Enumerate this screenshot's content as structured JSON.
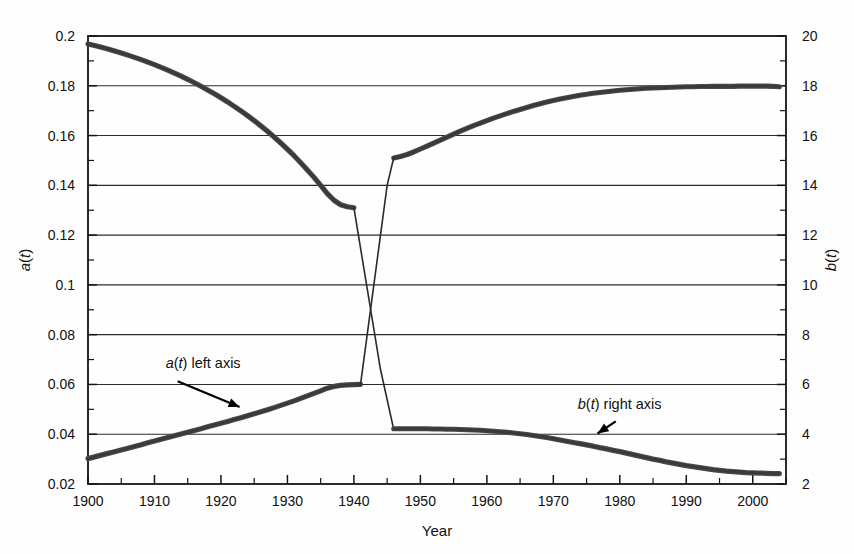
{
  "chart_data": {
    "type": "line",
    "title": "",
    "xlabel": "Year",
    "ylabel_left": "a(t)",
    "ylabel_right": "b(t)",
    "xlim": [
      1900,
      2005
    ],
    "ylim_left": [
      0.02,
      0.2
    ],
    "ylim_right": [
      2,
      20
    ],
    "grid": true,
    "legend_position": "inline-annotations",
    "x_ticks": [
      1900,
      1910,
      1920,
      1930,
      1940,
      1950,
      1960,
      1970,
      1980,
      1990,
      2000
    ],
    "x_tick_labels": [
      "1900",
      "1910",
      "1920",
      "1930",
      "1940",
      "1950",
      "1960",
      "1970",
      "1980",
      "1990",
      "2000"
    ],
    "x_minor_step": 5,
    "y_ticks_left": [
      0.02,
      0.04,
      0.06,
      0.08,
      0.1,
      0.12,
      0.14,
      0.16,
      0.18,
      0.2
    ],
    "y_tick_labels_left": [
      "0.02",
      "0.04",
      "0.06",
      "0.08",
      "0.1",
      "0.12",
      "0.14",
      "0.16",
      "0.18",
      "0.2"
    ],
    "y_ticks_right": [
      2,
      4,
      6,
      8,
      10,
      12,
      14,
      16,
      18,
      20
    ],
    "y_tick_labels_right": [
      "2",
      "4",
      "6",
      "8",
      "10",
      "12",
      "14",
      "16",
      "18",
      "20"
    ],
    "y_minor_step_left": 0.01,
    "y_minor_step_right": 1,
    "annotations": [
      {
        "text": "a(t) left axis",
        "x": 1918,
        "y_left": 0.0665,
        "arrow_to_x": 1921,
        "arrow_to_y_left": 0.0505
      },
      {
        "text": "b(t) right axis",
        "x": 1983,
        "y_right": 5.0,
        "arrow_to_x": 1978,
        "arrow_to_y_right": 4.15
      }
    ],
    "series": [
      {
        "name": "a(t) left axis",
        "axis": "left",
        "color": "#424242",
        "note": "Declining branch 1900-1940, wartime drop to crossing, recovering branch 1946-2004",
        "segments": [
          {
            "id": "decline-1900-1940",
            "x": [
              1900,
              1901,
              1902,
              1903,
              1904,
              1905,
              1906,
              1907,
              1908,
              1909,
              1910,
              1911,
              1912,
              1913,
              1914,
              1915,
              1916,
              1917,
              1918,
              1919,
              1920,
              1921,
              1922,
              1923,
              1924,
              1925,
              1926,
              1927,
              1928,
              1929,
              1930,
              1931,
              1932,
              1933,
              1934,
              1935,
              1936,
              1937,
              1938,
              1939,
              1940
            ],
            "y": [
              0.1968,
              0.1962,
              0.1955,
              0.1948,
              0.194,
              0.1932,
              0.1923,
              0.1914,
              0.1905,
              0.1895,
              0.1885,
              0.1874,
              0.1863,
              0.1851,
              0.1839,
              0.1826,
              0.1812,
              0.1798,
              0.1783,
              0.1768,
              0.1752,
              0.1735,
              0.1717,
              0.1699,
              0.168,
              0.166,
              0.1639,
              0.1617,
              0.1594,
              0.157,
              0.1545,
              0.1519,
              0.1491,
              0.1462,
              0.1432,
              0.14,
              0.1367,
              0.134,
              0.1322,
              0.1314,
              0.131
            ]
          },
          {
            "id": "wartime-drop-1940-1946",
            "x": [
              1940,
              1942,
              1944,
              1946
            ],
            "y": [
              0.131,
              0.0985,
              0.066,
              0.0418
            ]
          },
          {
            "id": "recovery-1946-2004",
            "x": [
              1946,
              1947,
              1948,
              1949,
              1950,
              1951,
              1952,
              1953,
              1954,
              1955,
              1956,
              1957,
              1958,
              1959,
              1960,
              1961,
              1962,
              1963,
              1964,
              1965,
              1966,
              1967,
              1968,
              1969,
              1970,
              1971,
              1972,
              1973,
              1974,
              1975,
              1976,
              1977,
              1978,
              1979,
              1980,
              1981,
              1982,
              1983,
              1984,
              1985,
              1986,
              1987,
              1988,
              1989,
              1990,
              1991,
              1992,
              1993,
              1994,
              1995,
              1996,
              1997,
              1998,
              1999,
              2000,
              2001,
              2002,
              2003,
              2004
            ],
            "y": [
              0.151,
              0.1516,
              0.1524,
              0.1534,
              0.1546,
              0.1558,
              0.157,
              0.1582,
              0.1594,
              0.1606,
              0.1618,
              0.1629,
              0.164,
              0.165,
              0.166,
              0.167,
              0.1679,
              0.1688,
              0.1697,
              0.1705,
              0.1713,
              0.1721,
              0.1728,
              0.1735,
              0.1741,
              0.1747,
              0.1752,
              0.1757,
              0.1762,
              0.1766,
              0.177,
              0.1773,
              0.1776,
              0.1779,
              0.1782,
              0.1784,
              0.1786,
              0.1788,
              0.179,
              0.1791,
              0.1792,
              0.1793,
              0.1794,
              0.1795,
              0.1796,
              0.1796,
              0.1797,
              0.1797,
              0.1798,
              0.1798,
              0.1798,
              0.1798,
              0.1799,
              0.1799,
              0.1799,
              0.1799,
              0.1799,
              0.1798,
              0.1796
            ]
          }
        ]
      },
      {
        "name": "b(t) right axis",
        "axis": "right",
        "color": "#424242",
        "note": "Rising branch 1900-1940 on right scale, wartime spike, then slow decline 1946-2004",
        "segments": [
          {
            "id": "rise-1900-1940",
            "x": [
              1900,
              1901,
              1902,
              1903,
              1904,
              1905,
              1906,
              1907,
              1908,
              1909,
              1910,
              1911,
              1912,
              1913,
              1914,
              1915,
              1916,
              1917,
              1918,
              1919,
              1920,
              1921,
              1922,
              1923,
              1924,
              1925,
              1926,
              1927,
              1928,
              1929,
              1930,
              1931,
              1932,
              1933,
              1934,
              1935,
              1936,
              1937,
              1938,
              1939,
              1940,
              1941
            ],
            "y": [
              3.02,
              3.09,
              3.16,
              3.23,
              3.3,
              3.37,
              3.44,
              3.51,
              3.58,
              3.66,
              3.73,
              3.8,
              3.87,
              3.94,
              4.01,
              4.08,
              4.15,
              4.22,
              4.3,
              4.37,
              4.44,
              4.51,
              4.59,
              4.66,
              4.74,
              4.82,
              4.9,
              4.98,
              5.07,
              5.16,
              5.25,
              5.34,
              5.44,
              5.54,
              5.64,
              5.74,
              5.85,
              5.92,
              5.96,
              5.98,
              5.99,
              6.0
            ]
          },
          {
            "id": "wartime-spike-1941-1946",
            "x": [
              1941,
              1943,
              1945,
              1946
            ],
            "y": [
              6.0,
              10.0,
              14.0,
              15.12
            ]
          },
          {
            "id": "postwar-decline-1946-2004",
            "x": [
              1946,
              1947,
              1948,
              1949,
              1950,
              1951,
              1952,
              1953,
              1954,
              1955,
              1956,
              1957,
              1958,
              1959,
              1960,
              1961,
              1962,
              1963,
              1964,
              1965,
              1966,
              1967,
              1968,
              1969,
              1970,
              1971,
              1972,
              1973,
              1974,
              1975,
              1976,
              1977,
              1978,
              1979,
              1980,
              1981,
              1982,
              1983,
              1984,
              1985,
              1986,
              1987,
              1988,
              1989,
              1990,
              1991,
              1992,
              1993,
              1994,
              1995,
              1996,
              1997,
              1998,
              1999,
              2000,
              2001,
              2002,
              2003,
              2004
            ],
            "y": [
              4.22,
              4.22,
              4.22,
              4.22,
              4.22,
              4.22,
              4.21,
              4.21,
              4.2,
              4.2,
              4.19,
              4.18,
              4.17,
              4.16,
              4.14,
              4.12,
              4.1,
              4.08,
              4.05,
              4.02,
              3.99,
              3.95,
              3.91,
              3.87,
              3.82,
              3.77,
              3.72,
              3.67,
              3.62,
              3.57,
              3.52,
              3.46,
              3.41,
              3.35,
              3.3,
              3.24,
              3.18,
              3.12,
              3.06,
              3.0,
              2.95,
              2.89,
              2.84,
              2.79,
              2.74,
              2.7,
              2.66,
              2.62,
              2.58,
              2.55,
              2.52,
              2.5,
              2.48,
              2.46,
              2.45,
              2.44,
              2.43,
              2.42,
              2.42
            ]
          }
        ]
      }
    ]
  },
  "axes": {
    "x_axis_title": "Year",
    "y_left_title": "a(t)",
    "y_right_title": "b(t)"
  },
  "annotations": {
    "left_label_prefix": "a(t)",
    "left_label_suffix": " left axis",
    "left_label_full": "a(t) left axis",
    "right_label_prefix": "b(t)",
    "right_label_suffix": " right axis",
    "right_label_full": "b(t) right axis"
  },
  "colors": {
    "series": "#424242",
    "grid": "#2b2b2b",
    "frame": "#151515",
    "background": "#fefefe",
    "text": "#111111"
  }
}
